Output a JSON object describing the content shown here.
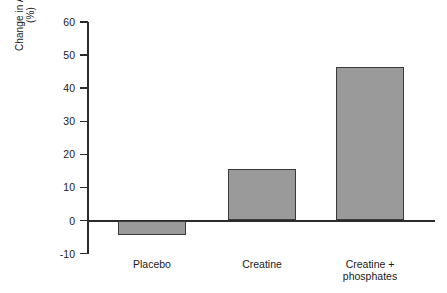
{
  "chart_data": {
    "type": "bar",
    "title": "",
    "xlabel": "",
    "ylabel": "Change in AWC (%)",
    "ylabel_line1": "Change in AWC",
    "ylabel_line2": "(%)",
    "categories": [
      "Placebo",
      "Creatine",
      "Creatine + phosphates"
    ],
    "category_labels": [
      {
        "line1": "Placebo",
        "line2": ""
      },
      {
        "line1": "Creatine",
        "line2": ""
      },
      {
        "line1": "Creatine +",
        "line2": "phosphates"
      }
    ],
    "values": [
      -4.5,
      15.7,
      46.5
    ],
    "ylim": [
      -10,
      60
    ],
    "yticks": [
      -10,
      0,
      10,
      20,
      30,
      40,
      50,
      60
    ],
    "ytick_labels": [
      "-10",
      "0",
      "10",
      "20",
      "30",
      "40",
      "50",
      "60"
    ],
    "grid": false,
    "legend": false,
    "bar_fill_color": "#9a9a9a",
    "bar_edge_color": "#3a3a3a",
    "axis_color": "#2b2b2b",
    "background_color": "#ffffff"
  }
}
